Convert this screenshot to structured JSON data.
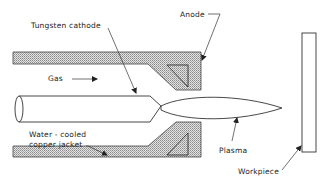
{
  "figure": {
    "labels": {
      "tungsten_cathode": "Tungsten cathode",
      "anode": "Anode",
      "gas": "Gas",
      "water_cooled_line1": "Water - cooled",
      "water_cooled_line2": "copper jacket",
      "plasma": "Plasma",
      "workpiece": "Workpiece"
    },
    "colors": {
      "line": "#333333",
      "hatch_fill": "#c8c8c8",
      "background": "#ffffff"
    }
  }
}
